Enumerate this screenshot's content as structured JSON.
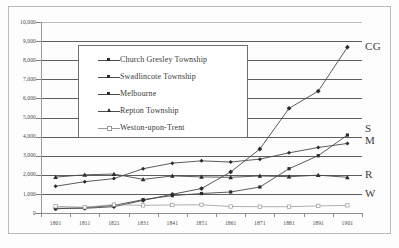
{
  "chart_data": {
    "type": "line",
    "title": "",
    "xlabel": "",
    "ylabel": "",
    "x": [
      "1801",
      "1811",
      "1821",
      "1831",
      "1841",
      "1851",
      "1861",
      "1871",
      "1881",
      "1891",
      "1901"
    ],
    "ylim": [
      0,
      10000
    ],
    "ytick_labels": [
      "10,000",
      "9,000",
      "8,000",
      "7,000",
      "6,000",
      "5,000",
      "4,000",
      "3,000",
      "2,000",
      "1,000",
      "0"
    ],
    "ytick_values": [
      10000,
      9000,
      8000,
      7000,
      6000,
      5000,
      4000,
      3000,
      2000,
      1000,
      0
    ],
    "grid": true,
    "legend_position": "upper-left-inset",
    "series": [
      {
        "name": "Church Gresley Township",
        "short": "CG",
        "marker": "filled-diamond",
        "values": [
          250,
          245,
          330,
          660,
          980,
          1280,
          2150,
          3350,
          5480,
          6380,
          8680
        ]
      },
      {
        "name": "Swadlincote Township",
        "short": "S",
        "marker": "filled-square",
        "values": [
          220,
          280,
          400,
          700,
          910,
          1020,
          1100,
          1360,
          2320,
          3000,
          4080
        ]
      },
      {
        "name": "Melbourne",
        "short": "M",
        "marker": "filled-diamond-small",
        "values": [
          1400,
          1640,
          1800,
          2320,
          2610,
          2730,
          2670,
          2820,
          3150,
          3430,
          3640
        ]
      },
      {
        "name": "Repton Township",
        "short": "R",
        "marker": "filled-triangle",
        "values": [
          1880,
          2000,
          2040,
          1760,
          1940,
          1890,
          1870,
          1940,
          1900,
          1980,
          1870
        ]
      },
      {
        "name": "Weston-upon-Trent",
        "short": "W",
        "marker": "hollow-square",
        "values": [
          350,
          300,
          440,
          400,
          420,
          430,
          340,
          330,
          330,
          370,
          400
        ]
      }
    ]
  },
  "axis": {
    "ytick_labels": [
      "10,000",
      "9,000",
      "8,000",
      "7,000",
      "6,000",
      "5,000",
      "4,000",
      "3,000",
      "2,000",
      "1,000",
      "0"
    ],
    "xtick_labels": [
      "1801",
      "1811",
      "1821",
      "1831",
      "1841",
      "1851",
      "1861",
      "1871",
      "1881",
      "1891",
      "1901"
    ]
  },
  "legend": {
    "items": [
      {
        "label": "Church Gresley Township"
      },
      {
        "label": "Swadlincote Township"
      },
      {
        "label": "Melbourne"
      },
      {
        "label": "Repton Township"
      },
      {
        "label": "Weston-upon-Trent"
      }
    ]
  },
  "series_tags": [
    {
      "label": "CG"
    },
    {
      "label": "S"
    },
    {
      "label": "M"
    },
    {
      "label": "R"
    },
    {
      "label": "W"
    }
  ],
  "colors": {
    "line": "#4a4a4a",
    "grid": "#5e5e5e",
    "axis": "#8d8d8d",
    "text": "#3a3a3a",
    "weston": "#9a9a9a"
  }
}
